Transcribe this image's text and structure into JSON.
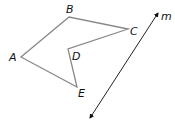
{
  "figure": {
    "polygon": {
      "vertices": [
        {
          "name": "A",
          "x": 21,
          "y": 57
        },
        {
          "name": "B",
          "x": 69,
          "y": 17
        },
        {
          "name": "C",
          "x": 128,
          "y": 29
        },
        {
          "name": "D",
          "x": 68,
          "y": 49
        },
        {
          "name": "E",
          "x": 77,
          "y": 87
        }
      ],
      "stroke": "#888888"
    },
    "line": {
      "label": "m",
      "from": {
        "x": 90,
        "y": 118
      },
      "to": {
        "x": 158,
        "y": 13
      },
      "stroke": "#222222"
    },
    "labels": {
      "A": "A",
      "B": "B",
      "C": "C",
      "D": "D",
      "E": "E",
      "m": "m"
    }
  }
}
